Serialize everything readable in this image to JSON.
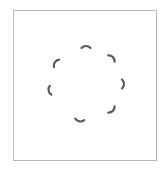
{
  "panel": {
    "border_color": "#b8b8b8",
    "background": "#ffffff"
  },
  "spinner": {
    "icon": "loading-spinner-icon",
    "color": "#5a5a5a",
    "center": [
      86,
      84
    ],
    "radius": 38,
    "segments": [
      {
        "angle": 270
      },
      {
        "angle": 315
      },
      {
        "angle": 0
      },
      {
        "angle": 45
      },
      {
        "angle": 100
      },
      {
        "angle": 170
      },
      {
        "angle": 215
      }
    ]
  }
}
